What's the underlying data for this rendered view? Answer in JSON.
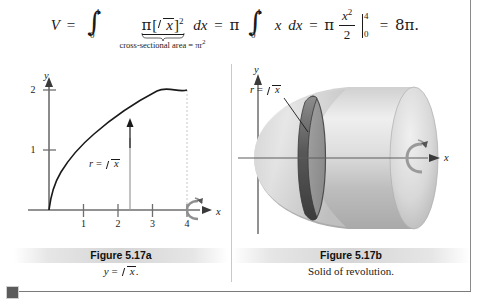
{
  "equation": {
    "lhs_var": "V",
    "equals": "=",
    "integral1": {
      "lower": "0",
      "upper": "4",
      "glyph": "∫"
    },
    "integrand1_pi": "π",
    "integrand1_open": "[",
    "integrand1_radicand": "x",
    "integrand1_close": "]",
    "integrand1_exponent": "2",
    "differential1": "dx",
    "brace_label": "cross-sectional area = πr",
    "brace_label_exponent": "2",
    "pi2": "π",
    "integral2": {
      "lower": "0",
      "upper": "4",
      "glyph": "∫"
    },
    "integrand2": "x",
    "differential2": "dx",
    "pi3": "π",
    "fraction": {
      "numerator": "x",
      "numerator_exponent": "2",
      "denominator": "2"
    },
    "eval_upper": "4",
    "eval_lower": "0",
    "result": "8π."
  },
  "figure_a": {
    "caption_title": "Figure 5.17a",
    "caption_subtitle": "y = √x.",
    "y_axis_label": "y",
    "x_axis_label": "x",
    "y_ticks": [
      "1",
      "2"
    ],
    "x_ticks": [
      "1",
      "2",
      "3",
      "4"
    ],
    "curve_label": "r = √x",
    "curve_label_prefix": "r",
    "curve_label_equals": "=",
    "curve_label_radicand": "x",
    "revolution_icon": "rotation-arrow-icon",
    "curve_color": "#1a1a1a",
    "axis_color": "#6e6e6e",
    "guide_color": "#c0c0c0"
  },
  "figure_b": {
    "caption_title": "Figure 5.17b",
    "caption_subtitle": "Solid of revolution.",
    "y_axis_label": "y",
    "x_axis_label": "x",
    "solid_label": "r = √x",
    "solid_label_prefix": "r",
    "solid_label_equals": "=",
    "solid_label_radicand": "x",
    "revolution_icon": "rotation-arrow-icon",
    "solid_light": "#e4e4e4",
    "solid_mid": "#c4c4c4",
    "solid_dark": "#9a9a9a",
    "disk_ring_color": "#4e4e4e",
    "axis_color": "#6e6e6e"
  },
  "page_frame": {
    "rule_color": "#7a7a7a",
    "marker_color": "#5b5b5b"
  }
}
